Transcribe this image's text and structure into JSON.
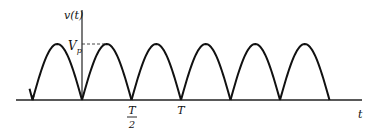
{
  "chart_data": {
    "type": "line",
    "title": "",
    "xlabel": "t",
    "ylabel": "v(t)",
    "peak_label": "Vp",
    "peak_label_main": "V",
    "peak_label_sub": "p",
    "x_ticks": [
      {
        "value": 0.5,
        "label_num": "T",
        "label_den": "2"
      },
      {
        "value": 1.0,
        "label": "T"
      }
    ],
    "period_T": 1,
    "amplitude_Vp": 1,
    "x_range": [
      -1.3,
      2.65
    ],
    "function": "Vp*|sin(2*pi*t/T)|",
    "series": [
      {
        "name": "v(t)",
        "zeros": [
          -1.0,
          -0.5,
          0,
          0.5,
          1.0,
          1.5,
          2.0,
          2.5
        ],
        "peak": 1
      }
    ],
    "colors": {
      "line": "#111111",
      "axis": "#222222",
      "background": "#ffffff"
    }
  }
}
